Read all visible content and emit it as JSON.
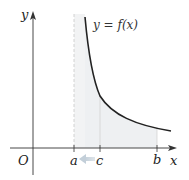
{
  "diagram": {
    "type": "improper-integral-graph",
    "function_label": "y = f(x)",
    "axes": {
      "x_label": "x",
      "y_label": "y",
      "origin_label": "O"
    },
    "points": [
      {
        "label": "a",
        "note": "vertical asymptote (dashed)"
      },
      {
        "label": "c",
        "note": "moves toward a (arrow)"
      },
      {
        "label": "b",
        "note": "right endpoint"
      }
    ],
    "colors": {
      "curve": "#222222",
      "axis": "#333333",
      "shade": "#eef0f2",
      "arrow": "#c9d3dc",
      "asymptote": "#c8c8c8"
    }
  }
}
